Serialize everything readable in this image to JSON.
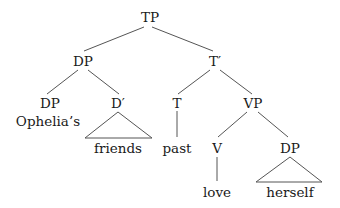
{
  "diagram": {
    "type": "syntax-tree",
    "nodes": {
      "tp": "TP",
      "dp_subject": "DP",
      "t_bar": "T′",
      "dp_possessor": "DP",
      "possessor_word": "Ophelia’s",
      "d_bar": "D′",
      "d_bar_word": "friends",
      "t": "T",
      "t_word": "past",
      "vp": "VP",
      "v": "V",
      "v_word": "love",
      "dp_object": "DP",
      "dp_object_word": "herself"
    },
    "edges": [
      [
        "TP",
        "DP"
      ],
      [
        "TP",
        "T′"
      ],
      [
        "DP",
        "DP"
      ],
      [
        "DP",
        "D′"
      ],
      [
        "T′",
        "T"
      ],
      [
        "T′",
        "VP"
      ],
      [
        "T",
        "past"
      ],
      [
        "VP",
        "V"
      ],
      [
        "VP",
        "DP"
      ],
      [
        "V",
        "love"
      ]
    ],
    "triangles": [
      [
        "D′",
        "friends"
      ],
      [
        "DP",
        "herself"
      ]
    ]
  }
}
